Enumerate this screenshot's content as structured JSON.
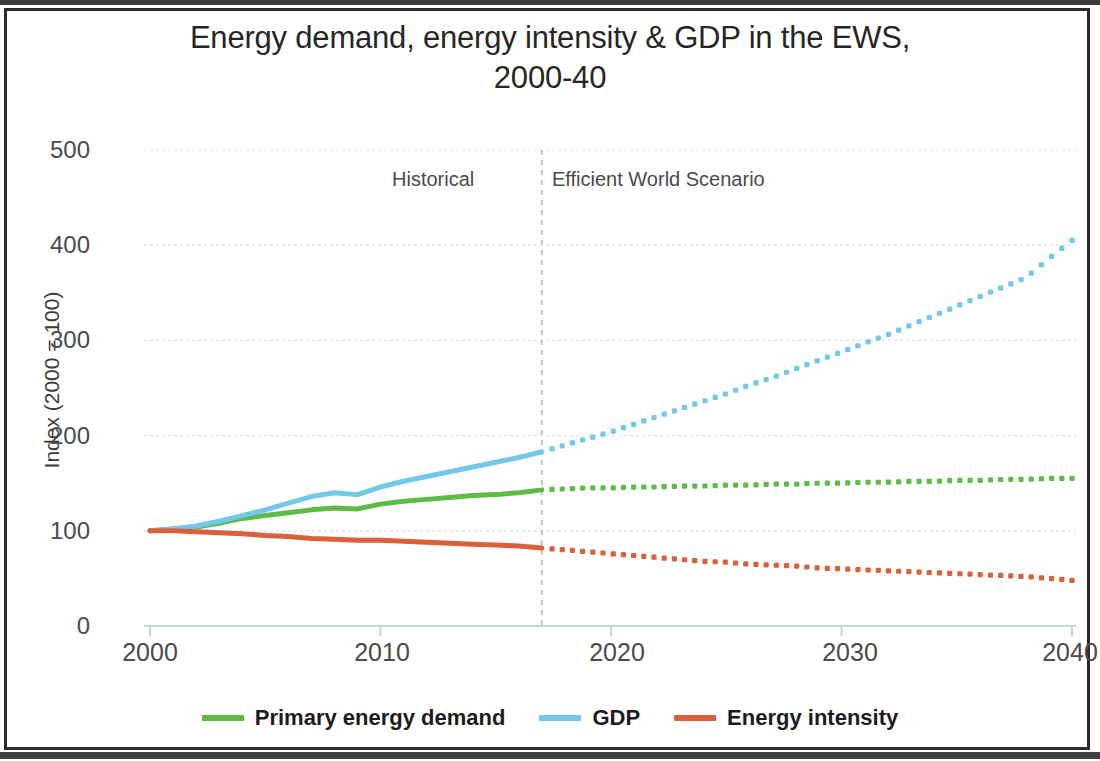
{
  "chart_data": {
    "type": "line",
    "title": "Energy demand, energy intensity & GDP in the EWS, 2000-40",
    "title_line1": "Energy demand, energy intensity & GDP in the EWS,",
    "title_line2": "2000-40",
    "xlabel": "",
    "ylabel": "Index (2000 = 100)",
    "xlim": [
      2000,
      2040
    ],
    "ylim": [
      0,
      500
    ],
    "xticks": [
      "2000",
      "2010",
      "2020",
      "2030",
      "2040"
    ],
    "xtick_values": [
      2000,
      2010,
      2020,
      2030,
      2040
    ],
    "yticks": [
      "0",
      "100",
      "200",
      "300",
      "400",
      "500"
    ],
    "ytick_values": [
      0,
      100,
      200,
      300,
      400,
      500
    ],
    "grid": true,
    "grid_axis": "y",
    "legend_position": "bottom",
    "split_year": 2017,
    "annotations": [
      {
        "text": "Historical",
        "x": 2012,
        "y": 460
      },
      {
        "text": "Efficient World Scenario",
        "x": 2019,
        "y": 460
      }
    ],
    "x": [
      2000,
      2001,
      2002,
      2003,
      2004,
      2005,
      2006,
      2007,
      2008,
      2009,
      2010,
      2011,
      2012,
      2013,
      2014,
      2015,
      2016,
      2017,
      2018,
      2019,
      2020,
      2021,
      2022,
      2023,
      2024,
      2025,
      2026,
      2027,
      2028,
      2029,
      2030,
      2031,
      2032,
      2033,
      2034,
      2035,
      2036,
      2037,
      2038,
      2039,
      2040
    ],
    "series": [
      {
        "name": "Primary energy demand",
        "color": "#5DBB46",
        "historical_style": "solid",
        "projection_style": "dotted",
        "values": [
          100,
          102,
          104,
          108,
          113,
          116,
          119,
          122,
          124,
          123,
          128,
          131,
          133,
          135,
          137,
          138,
          140,
          143,
          144,
          145,
          145,
          146,
          146,
          147,
          147,
          148,
          148,
          149,
          149,
          150,
          150,
          151,
          151,
          152,
          152,
          153,
          153,
          154,
          154,
          155,
          155
        ]
      },
      {
        "name": "GDP",
        "color": "#73C7E8",
        "historical_style": "solid",
        "projection_style": "dotted",
        "values": [
          100,
          102,
          105,
          110,
          116,
          122,
          129,
          136,
          140,
          138,
          146,
          152,
          157,
          162,
          167,
          172,
          177,
          183,
          190,
          197,
          204,
          212,
          220,
          228,
          236,
          244,
          253,
          261,
          270,
          279,
          288,
          297,
          306,
          316,
          326,
          336,
          346,
          356,
          366,
          386,
          405
        ]
      },
      {
        "name": "Energy intensity",
        "color": "#D9603B",
        "historical_style": "solid",
        "projection_style": "dotted",
        "values": [
          100,
          100,
          99,
          98,
          97,
          95,
          94,
          92,
          91,
          90,
          90,
          89,
          88,
          87,
          86,
          85,
          84,
          82,
          80,
          78,
          76,
          74,
          72,
          70,
          68,
          67,
          65,
          64,
          63,
          61,
          60,
          59,
          58,
          57,
          56,
          55,
          54,
          53,
          52,
          50,
          48
        ]
      }
    ]
  },
  "legend": [
    {
      "label": "Primary energy demand",
      "color": "#5DBB46"
    },
    {
      "label": "GDP",
      "color": "#73C7E8"
    },
    {
      "label": "Energy intensity",
      "color": "#D9603B"
    }
  ],
  "colors": {
    "primary_energy_demand": "#5DBB46",
    "gdp": "#73C7E8",
    "energy_intensity": "#D9603B",
    "grid": "#d8dde6",
    "axis": "#c4d2e3",
    "divider": "#9aa0a6",
    "text": "#4a4a4a",
    "title": "#262626",
    "frame": "#2b2b2b"
  }
}
